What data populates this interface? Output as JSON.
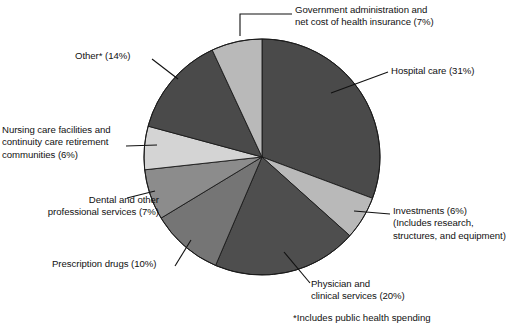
{
  "chart_data": {
    "type": "pie",
    "title": "",
    "subtitle": "",
    "xlabel": "",
    "ylabel": "",
    "grid": false,
    "legend_position": "none",
    "label_style": "callout-leader-lines",
    "start_angle_deg": 0,
    "direction": "clockwise",
    "total_percent": 101,
    "categories": [
      "Hospital care",
      "Investments",
      "Physician and clinical services",
      "Prescription drugs",
      "Dental and other professional services",
      "Nursing care facilities and continuity care retirement communities",
      "Other*",
      "Government administration and net cost of health insurance"
    ],
    "values": [
      31,
      6,
      20,
      10,
      7,
      6,
      14,
      7
    ],
    "slices": [
      {
        "name": "hospital-care",
        "label": "Hospital care (31%)",
        "value": 31,
        "color": "#4a4a4a",
        "start_deg": 0,
        "end_deg": 111.6
      },
      {
        "name": "investments",
        "label": "Investments (6%)\n(Includes research,\nstructures, and equipment)",
        "label_line1": "Investments (6%)",
        "label_line2": "(Includes research,",
        "label_line3": "structures, and equipment)",
        "value": 6,
        "color": "#b9b9b9",
        "start_deg": 111.6,
        "end_deg": 133.2
      },
      {
        "name": "physician-and-clinical-services",
        "label": "Physician and\nclinical services (20%)",
        "label_line1": "Physician and",
        "label_line2": "clinical services (20%)",
        "value": 20,
        "color": "#4e4e4e",
        "start_deg": 133.2,
        "end_deg": 205.2
      },
      {
        "name": "prescription-drugs",
        "label": "Prescription drugs (10%)",
        "value": 10,
        "color": "#757575",
        "start_deg": 205.2,
        "end_deg": 241.2
      },
      {
        "name": "dental-and-other-professional-services",
        "label": "Dental and other\nprofessional services (7%)",
        "label_line1": "Dental and other",
        "label_line2": "professional services (7%)",
        "value": 7,
        "color": "#8c8c8c",
        "start_deg": 241.2,
        "end_deg": 266.4
      },
      {
        "name": "nursing-care-facilities",
        "label": "Nursing care facilities and\ncontinuity care retirement\ncommunities (6%)",
        "label_line1": "Nursing care facilities and",
        "label_line2": "continuity care retirement",
        "label_line3": "communities (6%)",
        "value": 6,
        "color": "#d4d4d4",
        "start_deg": 266.4,
        "end_deg": 288.0
      },
      {
        "name": "other",
        "label": "Other* (14%)",
        "value": 14,
        "color": "#4a4a4a",
        "start_deg": 288.0,
        "end_deg": 338.4
      },
      {
        "name": "government-administration",
        "label": "Government administration and\nnet cost of health insurance (7%)",
        "label_line1": "Government administration and",
        "label_line2": "net cost of health insurance (7%)",
        "value": 7,
        "color": "#b9b9b9",
        "start_deg": 338.4,
        "end_deg": 360.0
      }
    ],
    "footnote": "*Includes public health spending",
    "geometry": {
      "center_x": 262,
      "center_y": 157,
      "radius": 118,
      "stroke_color": "#1a1a1a",
      "stroke_width": 0.9
    }
  }
}
